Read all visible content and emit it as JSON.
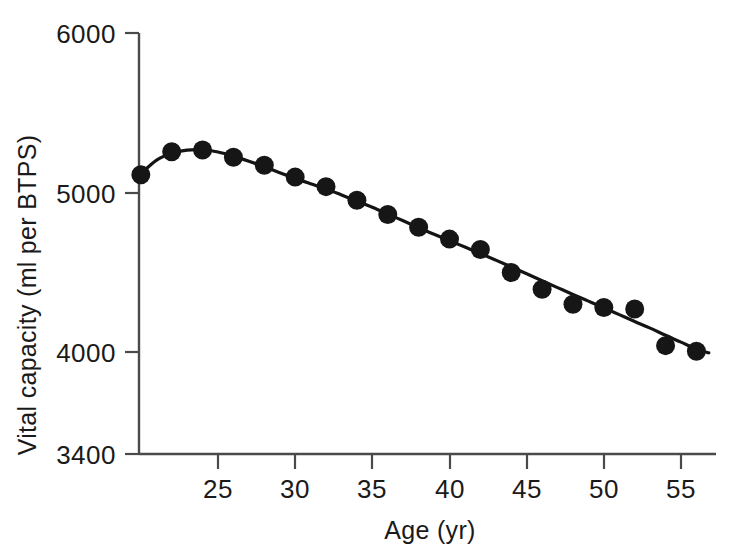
{
  "chart_data": {
    "type": "scatter",
    "title": "",
    "subtitle": "",
    "xlabel": "Age (yr)",
    "ylabel": "Vital capacity (ml per BTPS)",
    "xlim": [
      20,
      57.5
    ],
    "ylim": [
      3400,
      6000
    ],
    "xticks": [
      25,
      30,
      35,
      40,
      45,
      50,
      55
    ],
    "xtick_labels": [
      "25",
      "30",
      "35",
      "40",
      "45",
      "50",
      "55"
    ],
    "yticks": [
      3400,
      4000,
      5000,
      6000
    ],
    "ytick_labels": [
      "3400",
      "4000",
      "5000",
      "6000"
    ],
    "grid": false,
    "legend": null,
    "annotations": [],
    "marker": "filled-circle",
    "marker_color": "#161616",
    "line_color": "#141414",
    "series": [
      {
        "name": "Vital capacity",
        "x": [
          20,
          22,
          24,
          26,
          28,
          30,
          32,
          34,
          36,
          38,
          40,
          42,
          44,
          46,
          48,
          50,
          52,
          54,
          56
        ],
        "values": [
          5115,
          5260,
          5270,
          5225,
          5175,
          5100,
          5040,
          4955,
          4865,
          4785,
          4710,
          4645,
          4500,
          4395,
          4300,
          4280,
          4270,
          4040,
          4005
        ]
      },
      {
        "name": "Fitted curve",
        "type": "line",
        "x": [
          20,
          21,
          22,
          23,
          24,
          25,
          26,
          27,
          28,
          29,
          30,
          31,
          32,
          33,
          34,
          35,
          36,
          37,
          38,
          39,
          40,
          41,
          42,
          43,
          44,
          45,
          46,
          47,
          48,
          49,
          50,
          51,
          52,
          53,
          54,
          55,
          56,
          56.8
        ],
        "values": [
          5120,
          5205,
          5250,
          5270,
          5272,
          5258,
          5232,
          5200,
          5165,
          5128,
          5092,
          5058,
          5025,
          4988,
          4950,
          4910,
          4868,
          4825,
          4782,
          4740,
          4700,
          4660,
          4620,
          4578,
          4535,
          4492,
          4448,
          4405,
          4362,
          4320,
          4278,
          4235,
          4192,
          4150,
          4105,
          4062,
          4018,
          3995
        ]
      }
    ]
  },
  "axes": {
    "y_axis_name": "vital-capacity-axis",
    "x_axis_name": "age-axis"
  }
}
